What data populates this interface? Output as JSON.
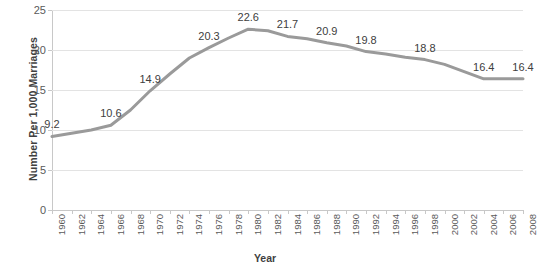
{
  "chart_data": {
    "type": "line",
    "title": "",
    "xlabel": "Year",
    "ylabel": "Number Per 1,000 Marriages",
    "xlim": [
      1960,
      2008
    ],
    "ylim": [
      0,
      25
    ],
    "ytick_values": [
      0,
      5,
      10,
      15,
      20,
      25
    ],
    "ytick_labels": [
      "0",
      "5",
      "10",
      "15",
      "20",
      "25"
    ],
    "xtick_labels": [
      "1960",
      "1962",
      "1964",
      "1966",
      "1968",
      "1970",
      "1972",
      "1974",
      "1976",
      "1978",
      "1980",
      "1982",
      "1984",
      "1986",
      "1988",
      "1990",
      "1992",
      "1994",
      "1996",
      "1998",
      "2000",
      "2002",
      "2004",
      "2006",
      "2008"
    ],
    "grid": "horizontal",
    "legend": "none",
    "line_color": "#9a9a9a",
    "line_width": 3,
    "x": [
      1960,
      1962,
      1964,
      1966,
      1968,
      1970,
      1972,
      1974,
      1976,
      1978,
      1980,
      1982,
      1984,
      1986,
      1988,
      1990,
      1992,
      1994,
      1996,
      1998,
      2000,
      2002,
      2004,
      2006,
      2008
    ],
    "values": [
      9.2,
      9.6,
      10.0,
      10.6,
      12.5,
      14.9,
      17.0,
      19.0,
      20.3,
      21.5,
      22.6,
      22.4,
      21.7,
      21.4,
      20.9,
      20.5,
      19.8,
      19.5,
      19.1,
      18.8,
      18.2,
      17.3,
      16.4,
      16.4,
      16.4
    ],
    "point_labels": [
      {
        "year": 1960,
        "value": 9.2,
        "text": "9.2"
      },
      {
        "year": 1966,
        "value": 10.6,
        "text": "10.6"
      },
      {
        "year": 1970,
        "value": 14.9,
        "text": "14.9"
      },
      {
        "year": 1976,
        "value": 20.3,
        "text": "20.3"
      },
      {
        "year": 1980,
        "value": 22.6,
        "text": "22.6"
      },
      {
        "year": 1984,
        "value": 21.7,
        "text": "21.7"
      },
      {
        "year": 1988,
        "value": 20.9,
        "text": "20.9"
      },
      {
        "year": 1992,
        "value": 19.8,
        "text": "19.8"
      },
      {
        "year": 1998,
        "value": 18.8,
        "text": "18.8"
      },
      {
        "year": 2004,
        "value": 16.4,
        "text": "16.4"
      },
      {
        "year": 2008,
        "value": 16.4,
        "text": "16.4"
      }
    ]
  }
}
